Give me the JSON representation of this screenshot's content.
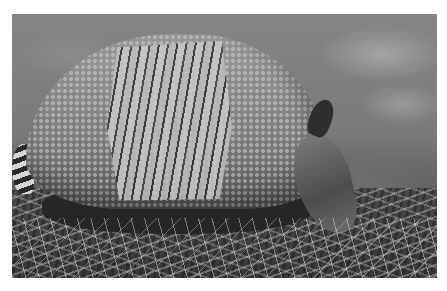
{
  "image": {
    "subject": "nine-banded armadillo foraging in grass",
    "style": "grayscale photograph",
    "border_color": "#ffffff",
    "photo_box": {
      "x": 12,
      "y": 14,
      "width": 425,
      "height": 264
    }
  }
}
